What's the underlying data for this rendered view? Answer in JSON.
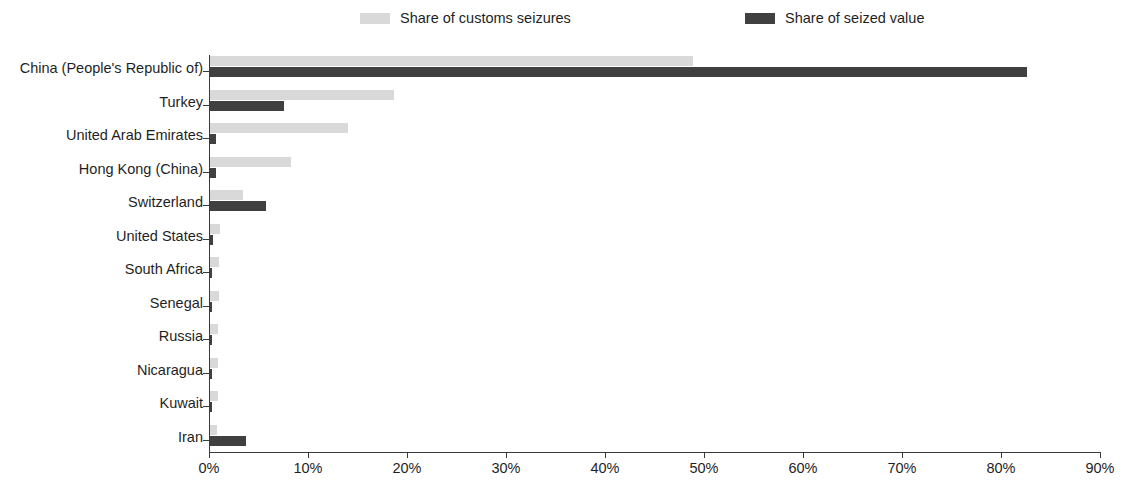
{
  "legend": {
    "position": "top",
    "entries": [
      {
        "label": "Share of customs seizures",
        "color": "#d9d9d9",
        "icon": "legend-swatch-light"
      },
      {
        "label": "Share of seized value",
        "color": "#404040",
        "icon": "legend-swatch-dark"
      }
    ]
  },
  "axis": {
    "x_ticks": [
      "0%",
      "10%",
      "20%",
      "30%",
      "40%",
      "50%",
      "60%",
      "70%",
      "80%",
      "90%"
    ]
  },
  "chart_data": {
    "type": "bar",
    "orientation": "horizontal",
    "title": "",
    "xlabel": "",
    "ylabel": "",
    "xlim": [
      0,
      90
    ],
    "x_tick_values": [
      0,
      10,
      20,
      30,
      40,
      50,
      60,
      70,
      80,
      90
    ],
    "x_tick_labels": [
      "0%",
      "10%",
      "20%",
      "30%",
      "40%",
      "50%",
      "60%",
      "70%",
      "80%",
      "90%"
    ],
    "grid": false,
    "legend_position": "top",
    "units": "percent",
    "categories": [
      "China (People's Republic of)",
      "Turkey",
      "United Arab Emirates",
      "Hong Kong (China)",
      "Switzerland",
      "United States",
      "South Africa",
      "Senegal",
      "Russia",
      "Nicaragua",
      "Kuwait",
      "Iran"
    ],
    "series": [
      {
        "name": "Share of customs seizures",
        "color": "#d9d9d9",
        "values": [
          48.8,
          18.6,
          13.9,
          8.2,
          3.3,
          1.0,
          0.9,
          0.9,
          0.8,
          0.8,
          0.8,
          0.7
        ]
      },
      {
        "name": "Share of seized value",
        "color": "#404040",
        "values": [
          82.5,
          7.5,
          0.6,
          0.6,
          5.7,
          0.3,
          0.2,
          0.2,
          0.2,
          0.2,
          0.2,
          3.6
        ]
      }
    ]
  }
}
